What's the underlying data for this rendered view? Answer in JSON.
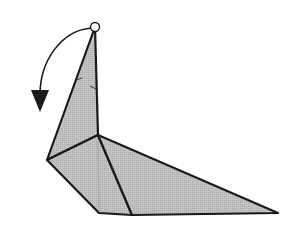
{
  "diagram": {
    "type": "origami-fold-step",
    "background": "#ffffff",
    "paper_fill": "#bdbdbd",
    "line_color": "#1a1a1a",
    "elements": {
      "model": "bird-figure",
      "action": "fold-down-arrow",
      "marker": "pivot-circle"
    }
  }
}
